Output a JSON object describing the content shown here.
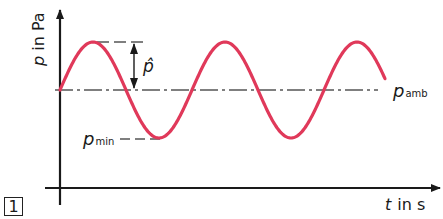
{
  "figure": {
    "number": "1",
    "y_axis_label": {
      "symbol": "p",
      "unit_text": " in Pa"
    },
    "x_axis_label": {
      "symbol": "t",
      "unit_text": "in s"
    },
    "annotations": {
      "amplitude": {
        "symbol": "p̂"
      },
      "ambient": {
        "symbol": "p",
        "subscript": "amb"
      },
      "minimum": {
        "symbol": "p",
        "subscript": "min"
      }
    },
    "colors": {
      "curve": "#e0395a",
      "axes": "#1a1a1a",
      "reference_lines": "#555555"
    }
  },
  "chart_data": {
    "type": "line",
    "title": "",
    "xlabel": "t in s",
    "ylabel": "p in Pa",
    "series": [
      {
        "name": "p(t)",
        "function": "p_amb + p̂·sin(2πt/T)",
        "periods_shown": 2.4
      }
    ],
    "reference_lines": [
      {
        "name": "p_amb",
        "style": "dash-dot",
        "value": "p_amb"
      },
      {
        "name": "peak",
        "style": "dashed",
        "value": "p_amb + p̂"
      },
      {
        "name": "p_min",
        "style": "dashed",
        "value": "p_amb − p̂"
      }
    ],
    "grid": false,
    "ticks": "none"
  }
}
